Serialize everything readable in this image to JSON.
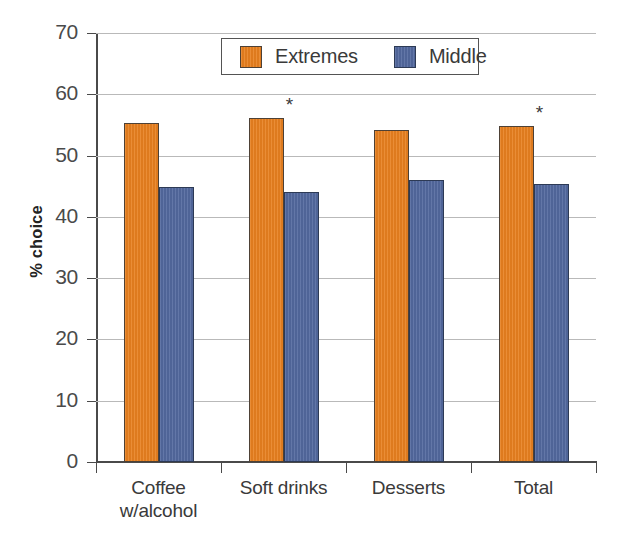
{
  "chart_data": {
    "type": "bar",
    "title": "",
    "xlabel": "",
    "ylabel": "% choice",
    "ylim": [
      0,
      70
    ],
    "ytick_step": 10,
    "yticks": [
      70,
      60,
      50,
      40,
      30,
      20,
      10,
      0
    ],
    "grid": true,
    "legend_position": "upper-center",
    "categories": [
      "Coffee w/alcohol",
      "Soft drinks",
      "Desserts",
      "Total"
    ],
    "category_lines": [
      [
        "Coffee",
        "w/alcohol"
      ],
      [
        "Soft drinks"
      ],
      [
        "Desserts"
      ],
      [
        "Total"
      ]
    ],
    "series": [
      {
        "name": "Extremes",
        "color": "#e8801f",
        "values": [
          55.3,
          56.1,
          54.1,
          54.8
        ]
      },
      {
        "name": "Middle",
        "color": "#53699f",
        "values": [
          44.9,
          44.0,
          46.0,
          45.4
        ]
      }
    ],
    "annotations": [
      {
        "category": "Soft drinks",
        "series": "Extremes",
        "text": "*"
      },
      {
        "category": "Total",
        "series": "Extremes",
        "text": "*"
      }
    ]
  },
  "axis": {
    "y_title": "% choice",
    "y_tick_labels": [
      "70",
      "60",
      "50",
      "40",
      "30",
      "20",
      "10",
      "0"
    ]
  },
  "legend": {
    "entries": [
      {
        "label": "Extremes",
        "swatch": "extremes-swatch"
      },
      {
        "label": "Middle",
        "swatch": "middle-swatch"
      }
    ]
  }
}
